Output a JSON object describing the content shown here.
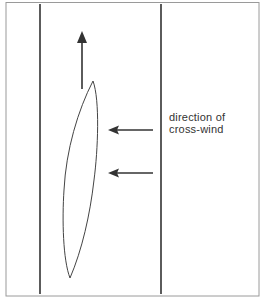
{
  "diagram": {
    "label": {
      "line1": "direction of",
      "line2": "cross-wind"
    },
    "colors": {
      "background": "#ffffff",
      "frame": "#9a9a9a",
      "line": "#333333",
      "arrow": "#333333",
      "sail": "#444444"
    },
    "elements": {
      "frame": {
        "x": 6,
        "y": 2,
        "width": 253,
        "height": 294
      },
      "left_boundary_x": 40,
      "right_boundary_x": 161,
      "heading_arrow": {
        "x": 82,
        "y_from": 89,
        "y_to": 32,
        "direction": "up"
      },
      "wind_arrows": [
        {
          "y": 130,
          "x_from": 153,
          "x_to": 108,
          "direction": "left"
        },
        {
          "y": 173,
          "x_from": 153,
          "x_to": 108,
          "direction": "left"
        }
      ],
      "sail": {
        "top": [
          93,
          81
        ],
        "bottom": [
          70,
          278
        ]
      }
    }
  }
}
